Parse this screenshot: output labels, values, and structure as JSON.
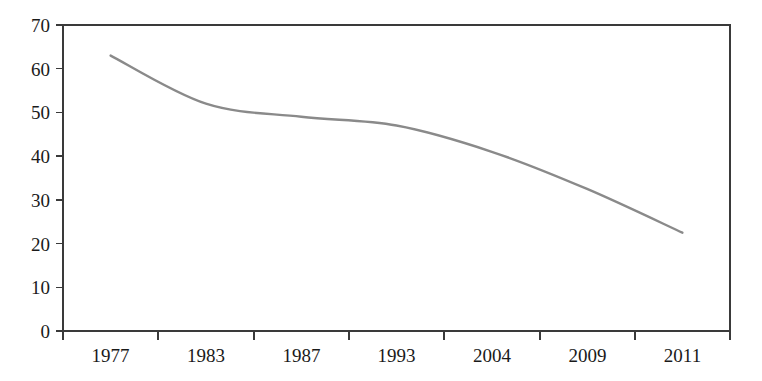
{
  "chart_data": {
    "type": "line",
    "title": "",
    "subtitle": "",
    "xlabel": "",
    "ylabel": "",
    "categories": [
      "1977",
      "1983",
      "1987",
      "1993",
      "2004",
      "2009",
      "2011"
    ],
    "x": [
      "1977",
      "1983",
      "1987",
      "1993",
      "2004",
      "2009",
      "2011"
    ],
    "values": [
      63,
      52,
      49,
      47,
      41,
      32.5,
      22.5
    ],
    "series": [
      {
        "name": "series-1",
        "color": "#8a8a8a",
        "values": [
          63,
          52,
          49,
          47,
          41,
          32.5,
          22.5
        ]
      }
    ],
    "ylim": [
      0,
      70
    ],
    "yticks": [
      0,
      10,
      20,
      30,
      40,
      50,
      60,
      70
    ],
    "ytick_labels": [
      "0",
      "10",
      "20",
      "30",
      "40",
      "50",
      "60",
      "70"
    ],
    "xtick_labels": [
      "1977",
      "1983",
      "1987",
      "1993",
      "2004",
      "2009",
      "2011"
    ],
    "grid": false,
    "legend": false,
    "legend_position": "none",
    "annotations": [],
    "smooth": true
  },
  "axes": {
    "y_axis_name": "y-axis",
    "x_axis_name": "x-axis",
    "frame_color": "#3a3a3a",
    "background_color": "#ffffff"
  }
}
